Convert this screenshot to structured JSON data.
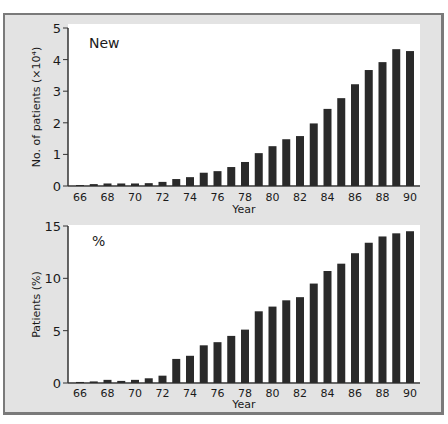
{
  "chart_data": [
    {
      "type": "bar",
      "panel_label": "New",
      "title": "New",
      "xlabel": "Year",
      "ylabel": "No. of patients (×10⁴)",
      "ylim": [
        0,
        5
      ],
      "yticks": [
        0,
        1,
        2,
        3,
        4,
        5
      ],
      "xtick_labels": [
        "66",
        "68",
        "70",
        "72",
        "74",
        "76",
        "78",
        "80",
        "82",
        "84",
        "86",
        "88",
        "90"
      ],
      "categories": [
        66,
        67,
        68,
        69,
        70,
        71,
        72,
        73,
        74,
        75,
        76,
        77,
        78,
        79,
        80,
        81,
        82,
        83,
        84,
        85,
        86,
        87,
        88,
        89,
        90
      ],
      "values": [
        0.03,
        0.06,
        0.08,
        0.08,
        0.08,
        0.09,
        0.13,
        0.22,
        0.28,
        0.42,
        0.47,
        0.6,
        0.76,
        1.04,
        1.26,
        1.48,
        1.58,
        1.98,
        2.44,
        2.78,
        3.22,
        3.67,
        3.92,
        4.33,
        4.27
      ],
      "grid": false,
      "color": "#2a2a2a"
    },
    {
      "type": "bar",
      "panel_label": "%",
      "title": "%",
      "xlabel": "Year",
      "ylabel": "Patients (%)",
      "ylim": [
        0,
        15
      ],
      "yticks": [
        0,
        5,
        10,
        15
      ],
      "xtick_labels": [
        "66",
        "68",
        "70",
        "72",
        "74",
        "76",
        "78",
        "80",
        "82",
        "84",
        "86",
        "88",
        "90"
      ],
      "categories": [
        66,
        67,
        68,
        69,
        70,
        71,
        72,
        73,
        74,
        75,
        76,
        77,
        78,
        79,
        80,
        81,
        82,
        83,
        84,
        85,
        86,
        87,
        88,
        89,
        90
      ],
      "values": [
        0.1,
        0.15,
        0.3,
        0.2,
        0.3,
        0.45,
        0.7,
        2.3,
        2.6,
        3.6,
        3.9,
        4.5,
        5.1,
        6.85,
        7.3,
        7.9,
        8.2,
        9.5,
        10.7,
        11.4,
        12.4,
        13.4,
        14.0,
        14.3,
        14.5
      ],
      "grid": false,
      "color": "#2a2a2a"
    }
  ]
}
